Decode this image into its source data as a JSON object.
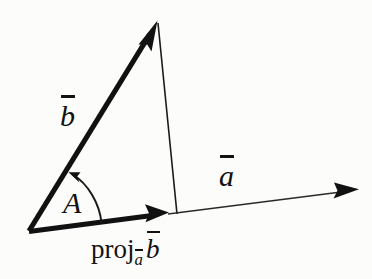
{
  "figure": {
    "background_color": "#fcfcfb",
    "ink_color": "#121212",
    "labels": {
      "vector_b": "b",
      "vector_b_overbar": true,
      "vector_a": "a",
      "vector_a_overbar": true,
      "angle": "A",
      "projection_word": "proj",
      "projection_subscript": "a",
      "projection_subscript_overbar": true,
      "projection_operand": "b",
      "projection_operand_overbar": true,
      "projection_full_text": "proj_a b"
    },
    "geometry": {
      "origin": [
        28,
        231
      ],
      "b_tip": [
        157,
        21
      ],
      "proj_tip": [
        168,
        212
      ],
      "a_tip": [
        358,
        189
      ],
      "foot_of_perpendicular": [
        177,
        213
      ],
      "angle_arc_start": [
        101,
        223
      ],
      "angle_arc_end": [
        70,
        173
      ]
    },
    "elements": [
      {
        "name": "vector-b",
        "type": "arrow",
        "weight": "thick"
      },
      {
        "name": "vector-projection",
        "type": "arrow",
        "weight": "thick"
      },
      {
        "name": "vector-a",
        "type": "arrow",
        "weight": "thin"
      },
      {
        "name": "drop-line",
        "type": "line",
        "weight": "thin"
      },
      {
        "name": "angle-arc",
        "type": "arc-arrow",
        "weight": "thin"
      }
    ]
  }
}
